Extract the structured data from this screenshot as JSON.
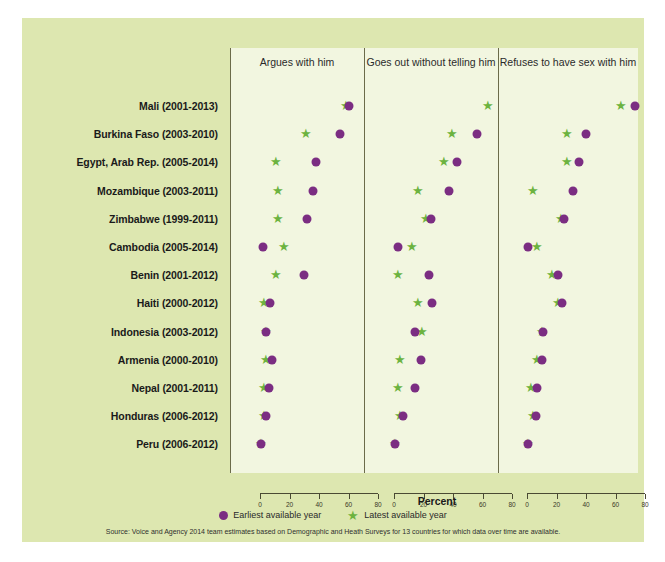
{
  "figure": {
    "percent_axis_label": "Percent",
    "source": "Source: Voice and Agency 2014 team estimates based on Demographic and Heath Surveys for 13 countries for which data over time are available.",
    "background_color": "#dde7b0",
    "panel_color": "#f2f6e0"
  },
  "legend": {
    "position": "bottom-center",
    "entries": [
      {
        "label": "Earliest available year",
        "marker": "circle",
        "color": "#7b2d82"
      },
      {
        "label": "Latest available year",
        "marker": "star",
        "color": "#6cb33f"
      }
    ]
  },
  "chart_data": {
    "type": "scatter",
    "title": "",
    "subtitle": "",
    "xlabel": "Percent",
    "ylabel": "",
    "xlim": [
      0,
      80
    ],
    "xticks": [
      0,
      20,
      40,
      60,
      80
    ],
    "grid": false,
    "legend_position": "bottom-center",
    "categories": [
      "Mali (2001-2013)",
      "Burkina Faso (2003-2010)",
      "Egypt, Arab Rep. (2005-2014)",
      "Mozambique (2003-2011)",
      "Zimbabwe (1999-2011)",
      "Cambodia (2005-2014)",
      "Benin (2001-2012)",
      "Haiti (2000-2012)",
      "Indonesia (2003-2012)",
      "Armenia (2000-2010)",
      "Nepal (2001-2011)",
      "Honduras (2006-2012)",
      "Peru (2006-2012)"
    ],
    "panels": [
      {
        "title": "Argues with him",
        "series": [
          {
            "name": "Earliest available year",
            "marker": "circle",
            "color": "#7b2d82",
            "values": [
              60,
              54,
              38,
              36,
              32,
              2,
              30,
              7,
              4,
              8,
              6,
              4,
              1
            ]
          },
          {
            "name": "Latest available year",
            "marker": "star",
            "color": "#6cb33f",
            "values": [
              58,
              31,
              11,
              12,
              12,
              16,
              11,
              3,
              4,
              4,
              3,
              3,
              1
            ]
          }
        ]
      },
      {
        "title": "Goes out without telling him",
        "series": [
          {
            "name": "Earliest available year",
            "marker": "circle",
            "color": "#7b2d82",
            "values": [
              78,
              56,
              43,
              37,
              25,
              3,
              24,
              26,
              14,
              18,
              14,
              6,
              1
            ]
          },
          {
            "name": "Latest available year",
            "marker": "star",
            "color": "#6cb33f",
            "values": [
              64,
              39,
              34,
              16,
              22,
              12,
              3,
              16,
              19,
              4,
              3,
              4,
              1
            ]
          }
        ]
      },
      {
        "title": "Refuses to have sex with him",
        "series": [
          {
            "name": "Earliest available year",
            "marker": "circle",
            "color": "#7b2d82",
            "values": [
              73,
              40,
              35,
              31,
              25,
              1,
              21,
              24,
              11,
              10,
              7,
              6,
              1
            ]
          },
          {
            "name": "Latest available year",
            "marker": "star",
            "color": "#6cb33f",
            "values": [
              64,
              27,
              27,
              4,
              23,
              7,
              17,
              21,
              10,
              7,
              3,
              4,
              1
            ]
          }
        ]
      }
    ]
  }
}
